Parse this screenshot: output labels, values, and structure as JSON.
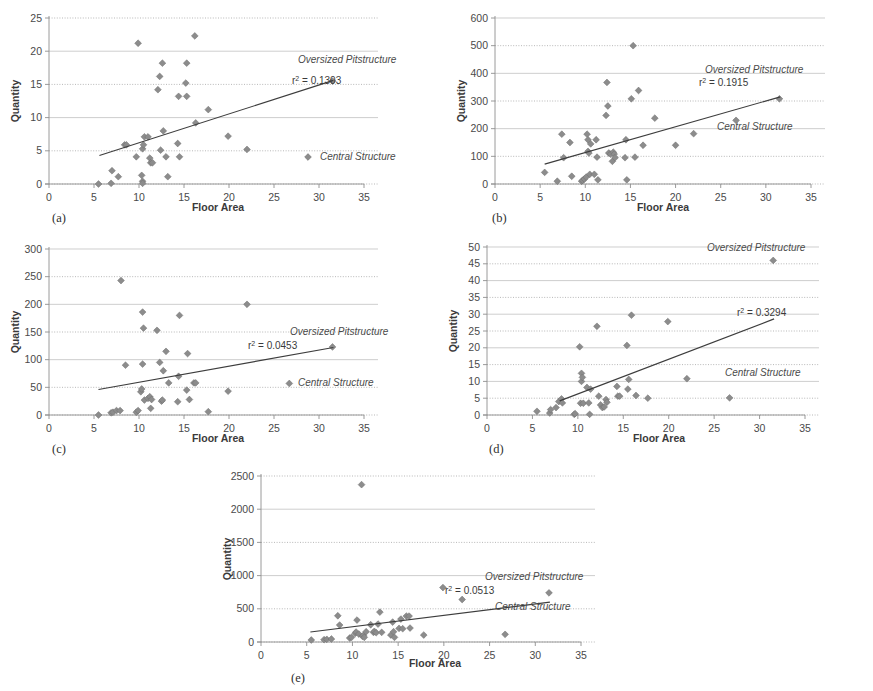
{
  "figure": {
    "panel_count": 5,
    "shared": {
      "xlabel": "Floor Area",
      "ylabel": "Quantity",
      "xlim": [
        0,
        35
      ],
      "xticks": [
        0,
        5,
        10,
        15,
        20,
        25,
        30,
        35
      ],
      "legend_oversized": "Oversized Pitstructure",
      "legend_central": "Central Structure",
      "marker_color": "#8c8c8c",
      "trend_color": "#3d3d3d",
      "grid_color": "#b9b9b9"
    }
  },
  "chart_data": [
    {
      "panel": "(a)",
      "type": "scatter",
      "title": "",
      "xlabel": "Floor Area",
      "ylabel": "Quantity",
      "xlim": [
        0,
        35
      ],
      "ylim": [
        0,
        25
      ],
      "xticks": [
        0,
        5,
        10,
        15,
        20,
        25,
        30,
        35
      ],
      "yticks": [
        0,
        5,
        10,
        15,
        20,
        25
      ],
      "grid": true,
      "r2_label": "r² = 0.1303",
      "r2_value": 0.1303,
      "annotations": [
        "Oversized Pitstructure",
        "Central Structure"
      ],
      "legend_position": "inside-right",
      "trendline": {
        "x": [
          5.6,
          31.6
        ],
        "y": [
          4.3,
          15.6
        ]
      },
      "points": [
        [
          5.5,
          0.0
        ],
        [
          6.9,
          0.1
        ],
        [
          7.0,
          2.0
        ],
        [
          7.7,
          1.1
        ],
        [
          8.4,
          5.9
        ],
        [
          8.6,
          5.9
        ],
        [
          9.7,
          4.1
        ],
        [
          9.9,
          21.2
        ],
        [
          10.3,
          1.3
        ],
        [
          10.4,
          0.4
        ],
        [
          10.4,
          0.1
        ],
        [
          10.4,
          5.3
        ],
        [
          10.5,
          5.9
        ],
        [
          10.6,
          7.1
        ],
        [
          11.0,
          7.1
        ],
        [
          11.2,
          3.9
        ],
        [
          11.3,
          3.2
        ],
        [
          11.5,
          3.2
        ],
        [
          12.1,
          14.2
        ],
        [
          12.3,
          16.2
        ],
        [
          12.4,
          5.1
        ],
        [
          12.6,
          18.2
        ],
        [
          12.7,
          8.0
        ],
        [
          13.0,
          4.1
        ],
        [
          13.2,
          1.1
        ],
        [
          14.3,
          6.1
        ],
        [
          14.4,
          13.2
        ],
        [
          14.5,
          4.1
        ],
        [
          15.2,
          15.2
        ],
        [
          15.3,
          13.2
        ],
        [
          15.3,
          18.2
        ],
        [
          16.2,
          22.3
        ],
        [
          16.3,
          9.2
        ],
        [
          17.7,
          11.2
        ],
        [
          19.9,
          7.2
        ],
        [
          22.0,
          5.2
        ],
        [
          31.5,
          15.5
        ]
      ]
    },
    {
      "panel": "(b)",
      "type": "scatter",
      "title": "",
      "xlabel": "Floor Area",
      "ylabel": "Quantity",
      "xlim": [
        0,
        35
      ],
      "ylim": [
        0,
        600
      ],
      "xticks": [
        0,
        5,
        10,
        15,
        20,
        25,
        30,
        35
      ],
      "yticks": [
        0,
        100,
        200,
        300,
        400,
        500,
        600
      ],
      "grid": true,
      "r2_label": "r² = 0.1915",
      "r2_value": 0.1915,
      "annotations": [
        "Oversized Pitstructure",
        "Central Structure"
      ],
      "legend_position": "inside-right",
      "trendline": {
        "x": [
          5.5,
          31.6
        ],
        "y": [
          72,
          315
        ]
      },
      "points": [
        [
          5.5,
          42
        ],
        [
          6.9,
          10
        ],
        [
          7.4,
          180
        ],
        [
          7.6,
          95
        ],
        [
          8.3,
          150
        ],
        [
          8.5,
          28
        ],
        [
          9.6,
          10
        ],
        [
          9.7,
          13
        ],
        [
          9.9,
          18
        ],
        [
          10.1,
          25
        ],
        [
          10.2,
          180
        ],
        [
          10.3,
          118
        ],
        [
          10.3,
          160
        ],
        [
          10.4,
          112
        ],
        [
          10.5,
          35
        ],
        [
          10.6,
          145
        ],
        [
          11.0,
          35
        ],
        [
          11.2,
          160
        ],
        [
          11.3,
          97
        ],
        [
          11.4,
          15
        ],
        [
          12.3,
          248
        ],
        [
          12.4,
          367
        ],
        [
          12.5,
          282
        ],
        [
          12.6,
          112
        ],
        [
          12.8,
          108
        ],
        [
          13.0,
          82
        ],
        [
          13.1,
          115
        ],
        [
          13.2,
          108
        ],
        [
          13.3,
          95
        ],
        [
          14.4,
          95
        ],
        [
          14.5,
          160
        ],
        [
          14.6,
          15
        ],
        [
          15.1,
          308
        ],
        [
          15.3,
          500
        ],
        [
          15.5,
          97
        ],
        [
          15.9,
          338
        ],
        [
          16.4,
          140
        ],
        [
          17.7,
          238
        ],
        [
          20.0,
          140
        ],
        [
          22.0,
          182
        ],
        [
          26.7,
          230
        ],
        [
          31.5,
          308
        ]
      ]
    },
    {
      "panel": "(c)",
      "type": "scatter",
      "title": "",
      "xlabel": "Floor Area",
      "ylabel": "Quantity",
      "xlim": [
        0,
        35
      ],
      "ylim": [
        0,
        300
      ],
      "xticks": [
        0,
        5,
        10,
        15,
        20,
        25,
        30,
        35
      ],
      "yticks": [
        0,
        50,
        100,
        150,
        200,
        250,
        300
      ],
      "grid": true,
      "r2_label": "r² = 0.0453",
      "r2_value": 0.0453,
      "annotations": [
        "Oversized Pitstructure",
        "Central Structure"
      ],
      "legend_position": "inside-right",
      "trendline": {
        "x": [
          5.5,
          31.6
        ],
        "y": [
          46,
          122
        ]
      },
      "points": [
        [
          5.5,
          0
        ],
        [
          6.9,
          4
        ],
        [
          7.1,
          5
        ],
        [
          7.5,
          8
        ],
        [
          7.9,
          8
        ],
        [
          8.0,
          243
        ],
        [
          8.5,
          90
        ],
        [
          9.7,
          5
        ],
        [
          9.9,
          8
        ],
        [
          10.2,
          42
        ],
        [
          10.3,
          47
        ],
        [
          10.4,
          92
        ],
        [
          10.4,
          186
        ],
        [
          10.5,
          157
        ],
        [
          10.6,
          27
        ],
        [
          11.0,
          30
        ],
        [
          11.2,
          33
        ],
        [
          11.3,
          12
        ],
        [
          11.4,
          28
        ],
        [
          12.0,
          153
        ],
        [
          12.3,
          95
        ],
        [
          12.5,
          25
        ],
        [
          12.6,
          27
        ],
        [
          12.7,
          80
        ],
        [
          13.0,
          115
        ],
        [
          13.3,
          58
        ],
        [
          14.3,
          24
        ],
        [
          14.4,
          70
        ],
        [
          14.5,
          180
        ],
        [
          15.3,
          45
        ],
        [
          15.4,
          111
        ],
        [
          15.6,
          28
        ],
        [
          16.1,
          58
        ],
        [
          16.3,
          58
        ],
        [
          17.7,
          6
        ],
        [
          19.9,
          43
        ],
        [
          22.0,
          200
        ],
        [
          26.7,
          57
        ],
        [
          31.5,
          123
        ]
      ]
    },
    {
      "panel": "(d)",
      "type": "scatter",
      "title": "",
      "xlabel": "Floor Area",
      "ylabel": "Quantity",
      "xlim": [
        0,
        35
      ],
      "ylim": [
        0,
        50
      ],
      "xticks": [
        0,
        5,
        10,
        15,
        20,
        25,
        30,
        35
      ],
      "yticks": [
        0,
        5,
        10,
        15,
        20,
        25,
        30,
        35,
        40,
        45,
        50
      ],
      "grid": true,
      "r2_label": "r² = 0.3294",
      "r2_value": 0.3294,
      "annotations": [
        "Oversized Pitstructure",
        "Central Structure"
      ],
      "legend_position": "inside-right",
      "trendline": {
        "x": [
          8.0,
          31.6
        ],
        "y": [
          4.2,
          28.6
        ]
      },
      "points": [
        [
          5.5,
          1.1
        ],
        [
          6.9,
          0.6
        ],
        [
          7.0,
          1.6
        ],
        [
          7.6,
          2.2
        ],
        [
          7.9,
          4.0
        ],
        [
          8.2,
          4.8
        ],
        [
          8.3,
          3.6
        ],
        [
          9.6,
          0.2
        ],
        [
          9.7,
          0.4
        ],
        [
          10.2,
          20.3
        ],
        [
          10.3,
          3.5
        ],
        [
          10.4,
          10.0
        ],
        [
          10.4,
          12.4
        ],
        [
          10.5,
          11.2
        ],
        [
          10.6,
          3.5
        ],
        [
          11.0,
          8.2
        ],
        [
          11.2,
          3.6
        ],
        [
          11.3,
          0.2
        ],
        [
          11.4,
          7.7
        ],
        [
          12.1,
          26.4
        ],
        [
          12.3,
          5.6
        ],
        [
          12.5,
          3.0
        ],
        [
          12.7,
          2.2
        ],
        [
          12.9,
          2.4
        ],
        [
          13.1,
          4.6
        ],
        [
          13.2,
          3.8
        ],
        [
          14.3,
          8.5
        ],
        [
          14.4,
          5.6
        ],
        [
          14.6,
          5.6
        ],
        [
          15.4,
          20.7
        ],
        [
          15.5,
          7.7
        ],
        [
          15.6,
          10.6
        ],
        [
          15.9,
          29.7
        ],
        [
          16.4,
          5.8
        ],
        [
          17.7,
          5.0
        ],
        [
          19.9,
          27.8
        ],
        [
          22.0,
          10.8
        ],
        [
          26.7,
          5.1
        ],
        [
          31.5,
          46.0
        ]
      ]
    },
    {
      "panel": "(e)",
      "type": "scatter",
      "title": "",
      "xlabel": "Floor Area",
      "ylabel": "Quantity",
      "xlim": [
        0,
        35
      ],
      "ylim": [
        0,
        2500
      ],
      "xticks": [
        0,
        5,
        10,
        15,
        20,
        25,
        30,
        35
      ],
      "yticks": [
        0,
        500,
        1000,
        1500,
        2000,
        2500
      ],
      "grid": true,
      "r2_label": "r² = 0.0513",
      "r2_value": 0.0513,
      "annotations": [
        "Oversized Pitstructure",
        "Central Structure"
      ],
      "legend_position": "inside-right",
      "trendline": {
        "x": [
          5.4,
          31.6
        ],
        "y": [
          150,
          600
        ]
      },
      "points": [
        [
          5.5,
          30
        ],
        [
          6.9,
          35
        ],
        [
          7.2,
          40
        ],
        [
          7.7,
          45
        ],
        [
          8.4,
          395
        ],
        [
          8.6,
          255
        ],
        [
          9.7,
          60
        ],
        [
          9.9,
          70
        ],
        [
          10.3,
          130
        ],
        [
          10.4,
          150
        ],
        [
          10.5,
          330
        ],
        [
          10.7,
          120
        ],
        [
          11.0,
          2370
        ],
        [
          11.1,
          85
        ],
        [
          11.2,
          100
        ],
        [
          11.3,
          70
        ],
        [
          11.5,
          155
        ],
        [
          12.0,
          260
        ],
        [
          12.3,
          145
        ],
        [
          12.4,
          160
        ],
        [
          12.6,
          140
        ],
        [
          12.8,
          270
        ],
        [
          13.0,
          450
        ],
        [
          13.2,
          145
        ],
        [
          14.2,
          105
        ],
        [
          14.4,
          300
        ],
        [
          14.5,
          155
        ],
        [
          14.6,
          70
        ],
        [
          15.1,
          205
        ],
        [
          15.3,
          345
        ],
        [
          15.5,
          200
        ],
        [
          15.9,
          390
        ],
        [
          16.2,
          390
        ],
        [
          16.3,
          210
        ],
        [
          17.8,
          105
        ],
        [
          19.9,
          820
        ],
        [
          22.0,
          640
        ],
        [
          26.7,
          115
        ],
        [
          31.5,
          740
        ]
      ]
    }
  ]
}
